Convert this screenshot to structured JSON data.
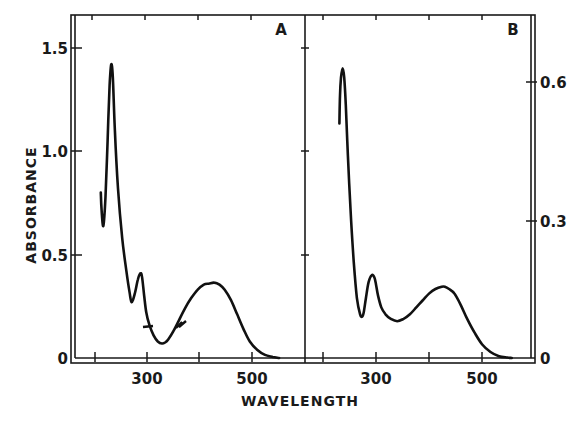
{
  "chart_data": [
    {
      "type": "line",
      "panel": "A",
      "title": "A",
      "xlabel": "WAVELENGTH",
      "ylabel": "ABSORBANCE",
      "xlim": [
        180,
        600
      ],
      "ylim": [
        0,
        1.65
      ],
      "x_ticks": [
        200,
        300,
        400,
        500
      ],
      "x_tick_labels": [
        "300",
        "500"
      ],
      "y_ticks": [
        0,
        0.5,
        1.0,
        1.5
      ],
      "y_tick_labels": [
        "0",
        "0.5",
        "1.0",
        "1.5"
      ],
      "y_axis_side": "left",
      "grid": false,
      "series": [
        {
          "name": "spectrum A",
          "x": [
            211,
            213,
            216,
            220,
            224,
            228,
            231,
            234,
            238,
            244,
            252,
            260,
            266,
            270,
            276,
            282,
            287,
            290,
            294,
            298,
            304,
            312,
            320,
            328,
            334,
            340,
            350,
            360,
            372,
            384,
            396,
            408,
            418,
            428,
            438,
            448,
            460,
            472,
            484,
            496,
            510,
            525,
            540,
            552
          ],
          "y": [
            0.8,
            0.7,
            0.64,
            0.78,
            1.05,
            1.32,
            1.42,
            1.36,
            1.1,
            0.82,
            0.58,
            0.42,
            0.32,
            0.27,
            0.31,
            0.38,
            0.41,
            0.39,
            0.3,
            0.22,
            0.16,
            0.11,
            0.08,
            0.07,
            0.075,
            0.09,
            0.13,
            0.18,
            0.24,
            0.29,
            0.33,
            0.355,
            0.36,
            0.365,
            0.355,
            0.33,
            0.28,
            0.21,
            0.14,
            0.08,
            0.04,
            0.015,
            0.005,
            0.0
          ]
        }
      ],
      "annotations": [
        "small marks on curve near 300 nm and 365 nm"
      ]
    },
    {
      "type": "line",
      "panel": "B",
      "title": "B",
      "xlabel": "WAVELENGTH",
      "ylabel": "",
      "xlim": [
        180,
        600
      ],
      "ylim": [
        0,
        0.72
      ],
      "x_ticks": [
        200,
        300,
        400,
        500
      ],
      "x_tick_labels": [
        "300",
        "500"
      ],
      "y_ticks": [
        0,
        0.3,
        0.6
      ],
      "y_tick_labels": [
        "0",
        "0.3",
        "0.6"
      ],
      "y_axis_side": "right",
      "grid": false,
      "series": [
        {
          "name": "spectrum B",
          "x": [
            231,
            232,
            234,
            237,
            240,
            243,
            247,
            252,
            258,
            264,
            270,
            274,
            277,
            281,
            286,
            292,
            297,
            300,
            304,
            310,
            318,
            328,
            340,
            352,
            364,
            376,
            388,
            400,
            412,
            424,
            430,
            438,
            448,
            460,
            472,
            486,
            500,
            516,
            532,
            548,
            556
          ],
          "y": [
            0.51,
            0.57,
            0.61,
            0.63,
            0.61,
            0.55,
            0.44,
            0.32,
            0.21,
            0.13,
            0.095,
            0.09,
            0.1,
            0.13,
            0.165,
            0.18,
            0.175,
            0.16,
            0.135,
            0.11,
            0.095,
            0.085,
            0.08,
            0.085,
            0.095,
            0.11,
            0.125,
            0.14,
            0.15,
            0.155,
            0.155,
            0.15,
            0.14,
            0.115,
            0.085,
            0.055,
            0.03,
            0.013,
            0.004,
            0.001,
            0.0
          ]
        }
      ]
    }
  ],
  "labels": {
    "ylabel": "ABSORBANCE",
    "xlabel": "WAVELENGTH",
    "panel_a": "A",
    "panel_b": "B",
    "left_ticks": [
      "1.5",
      "1.0",
      "0.5",
      "0"
    ],
    "right_ticks": [
      "0.6",
      "0.3",
      "0"
    ],
    "bottom_ticks_a": [
      "300",
      "500"
    ],
    "bottom_ticks_b": [
      "300",
      "500"
    ]
  }
}
